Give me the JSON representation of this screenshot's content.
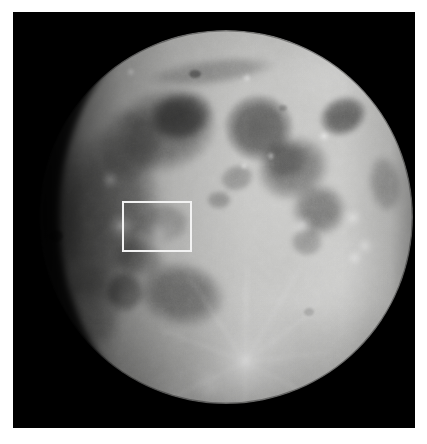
{
  "figure": {
    "kind": "astronomical-photograph",
    "phase": "waxing gibbous (near full)",
    "orientation": "north up, east right",
    "canvas": {
      "width": 427,
      "height": 444,
      "background": "#ffffff"
    },
    "photo_frame": {
      "x": 13,
      "y": 12,
      "width": 402,
      "height": 416,
      "background": "#000000"
    },
    "caption": "",
    "title": "",
    "labels": []
  },
  "moon": {
    "disk": {
      "cx": 213,
      "cy": 205,
      "r": 187
    },
    "terminator_side": "left",
    "limb_brightness_hex": "#d8d8d6",
    "mare_hex": "#6b6b6b",
    "highland_hex": "#b9b9b7",
    "shadow_hex": "#0a0a0a",
    "maria": [
      {
        "name": "Mare Imbrium",
        "cx": 150,
        "cy": 120,
        "rx": 56,
        "ry": 44,
        "rot": -18,
        "tone": "#707070"
      },
      {
        "name": "Mare Serenitatis",
        "cx": 243,
        "cy": 118,
        "rx": 35,
        "ry": 35,
        "rot": 10,
        "tone": "#666666"
      },
      {
        "name": "Mare Tranquillitatis",
        "cx": 278,
        "cy": 158,
        "rx": 36,
        "ry": 32,
        "rot": -20,
        "tone": "#696969"
      },
      {
        "name": "Mare Crisium",
        "cx": 330,
        "cy": 105,
        "rx": 24,
        "ry": 19,
        "rot": -25,
        "tone": "#5d5d5d"
      },
      {
        "name": "Mare Fecunditatis",
        "cx": 305,
        "cy": 200,
        "rx": 27,
        "ry": 26,
        "rot": 0,
        "tone": "#6e6e6e"
      },
      {
        "name": "Mare Nectaris",
        "cx": 295,
        "cy": 232,
        "rx": 17,
        "ry": 15,
        "rot": 0,
        "tone": "#6f6f6f"
      },
      {
        "name": "Oceanus Procellarum",
        "cx": 92,
        "cy": 200,
        "rx": 52,
        "ry": 86,
        "rot": 6,
        "tone": "#6f6f6f"
      },
      {
        "name": "Mare Nubium",
        "cx": 165,
        "cy": 285,
        "rx": 44,
        "ry": 34,
        "rot": 12,
        "tone": "#6d6d6d"
      },
      {
        "name": "Mare Humorum",
        "cx": 112,
        "cy": 282,
        "rx": 20,
        "ry": 22,
        "rot": 0,
        "tone": "#6a6a6a"
      },
      {
        "name": "Mare Vaporum",
        "cx": 222,
        "cy": 168,
        "rx": 17,
        "ry": 13,
        "rot": -15,
        "tone": "#727272"
      },
      {
        "name": "Mare Frigoris",
        "cx": 196,
        "cy": 62,
        "rx": 64,
        "ry": 13,
        "rot": -8,
        "tone": "#767676"
      }
    ],
    "craters": [
      {
        "name": "Copernicus",
        "cx": 146,
        "cy": 222,
        "r": 8,
        "type": "bright-ray"
      },
      {
        "name": "Kepler",
        "cx": 108,
        "cy": 214,
        "r": 5,
        "type": "bright-ray"
      },
      {
        "name": "Aristarchus",
        "cx": 97,
        "cy": 168,
        "r": 4,
        "type": "bright"
      },
      {
        "name": "Tycho",
        "cx": 232,
        "cy": 350,
        "r": 9,
        "type": "bright-ray"
      },
      {
        "name": "Plato",
        "cx": 182,
        "cy": 64,
        "r": 6,
        "type": "dark-floor"
      },
      {
        "name": "Langrenus",
        "cx": 340,
        "cy": 206,
        "r": 7,
        "type": "bright"
      },
      {
        "name": "Petavius",
        "cx": 342,
        "cy": 245,
        "r": 7,
        "type": "bright"
      },
      {
        "name": "Theophilus",
        "cx": 289,
        "cy": 213,
        "r": 8,
        "type": "bright"
      },
      {
        "name": "Grimaldi",
        "cx": 42,
        "cy": 222,
        "r": 6,
        "type": "dark-floor"
      },
      {
        "name": "Clavius",
        "cx": 196,
        "cy": 372,
        "r": 11,
        "type": "highland"
      },
      {
        "name": "Stevinus",
        "cx": 352,
        "cy": 232,
        "r": 4,
        "type": "bright"
      },
      {
        "name": "Proclus",
        "cx": 311,
        "cy": 124,
        "r": 3,
        "type": "bright"
      },
      {
        "name": "Menelaus",
        "cx": 258,
        "cy": 144,
        "r": 3,
        "type": "bright"
      },
      {
        "name": "Manilius",
        "cx": 232,
        "cy": 155,
        "r": 3,
        "type": "bright"
      }
    ]
  },
  "roi": {
    "name": "region-of-interest",
    "shape": "rectangle",
    "stroke_hex": "#f2f2f2",
    "stroke_width_px": 2.5,
    "fill": "none",
    "x_px": 122,
    "y_px": 201,
    "width_px": 71,
    "height_px": 52,
    "encloses": "Copernicus crater and surrounding Mare Insularum",
    "label": ""
  },
  "chart_data": {
    "type": "scatter",
    "title": "",
    "xlabel": "",
    "ylabel": "",
    "categories": [],
    "values": []
  }
}
